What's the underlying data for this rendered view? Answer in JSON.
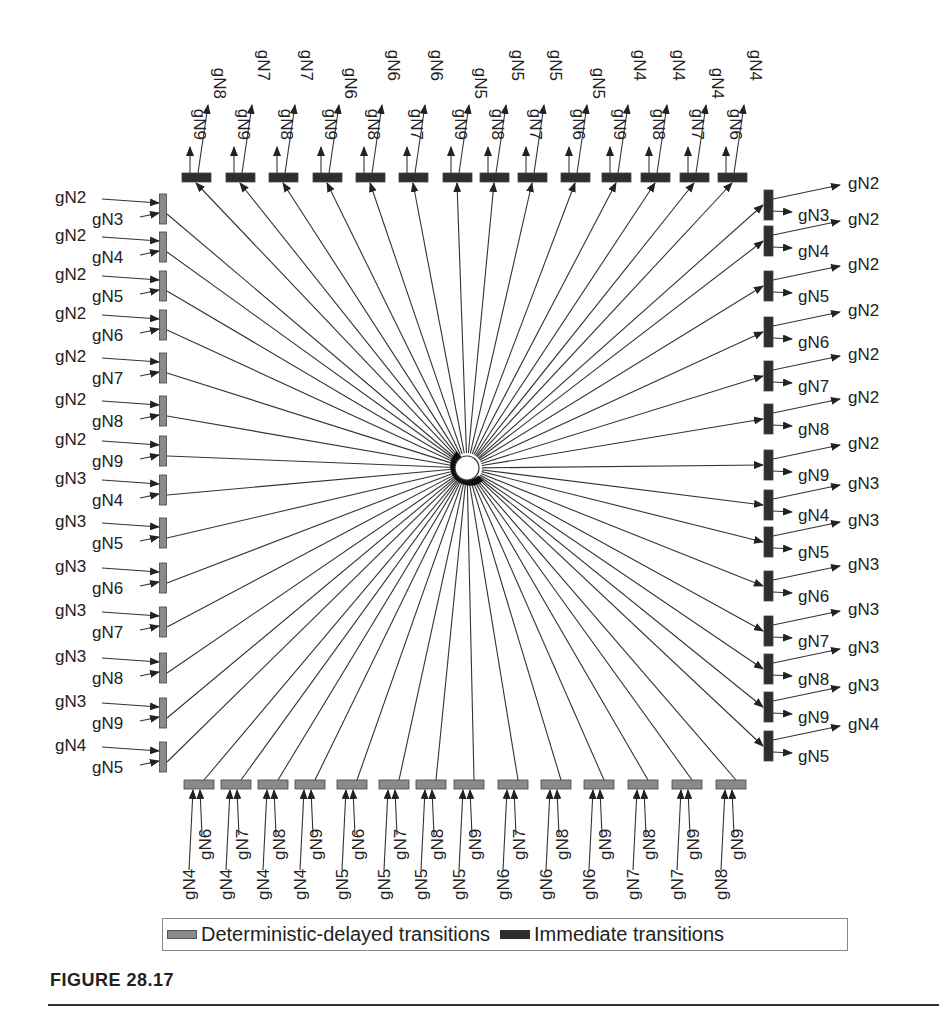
{
  "figure": {
    "caption": "FIGURE 28.17",
    "legend": {
      "deterministic_label": "Deterministic-delayed transitions",
      "immediate_label": "Immediate transitions"
    },
    "colors": {
      "deterministic": "#8a8a8a",
      "immediate": "#2e2e2e",
      "arc": "#333333"
    },
    "center_place": {
      "name": "central-place",
      "has_token_arc": true
    },
    "top_immediate": [
      {
        "near": "gN9",
        "far": "gN8"
      },
      {
        "near": "gN9",
        "far": "gN7"
      },
      {
        "near": "gN8",
        "far": "gN7"
      },
      {
        "near": "gN9",
        "far": "gN6"
      },
      {
        "near": "gN8",
        "far": "gN6"
      },
      {
        "near": "gN7",
        "far": "gN6"
      },
      {
        "near": "gN9",
        "far": "gN5"
      },
      {
        "near": "gN8",
        "far": "gN5"
      },
      {
        "near": "gN7",
        "far": "gN5"
      },
      {
        "near": "gN6",
        "far": "gN5"
      },
      {
        "near": "gN9",
        "far": "gN4"
      },
      {
        "near": "gN8",
        "far": "gN4"
      },
      {
        "near": "gN7",
        "far": "gN4"
      },
      {
        "near": "gN6",
        "far": "gN4"
      }
    ],
    "left_deterministic": [
      {
        "a": "gN2",
        "b": "gN3"
      },
      {
        "a": "gN2",
        "b": "gN4"
      },
      {
        "a": "gN2",
        "b": "gN5"
      },
      {
        "a": "gN2",
        "b": "gN6"
      },
      {
        "a": "gN2",
        "b": "gN7"
      },
      {
        "a": "gN2",
        "b": "gN8"
      },
      {
        "a": "gN2",
        "b": "gN9"
      },
      {
        "a": "gN3",
        "b": "gN4"
      },
      {
        "a": "gN3",
        "b": "gN5"
      },
      {
        "a": "gN3",
        "b": "gN6"
      },
      {
        "a": "gN3",
        "b": "gN7"
      },
      {
        "a": "gN3",
        "b": "gN8"
      },
      {
        "a": "gN3",
        "b": "gN9"
      },
      {
        "a": "gN4",
        "b": "gN5"
      }
    ],
    "right_immediate": [
      {
        "a": "gN2",
        "b": "gN3"
      },
      {
        "a": "gN2",
        "b": "gN4"
      },
      {
        "a": "gN2",
        "b": "gN5"
      },
      {
        "a": "gN2",
        "b": "gN6"
      },
      {
        "a": "gN2",
        "b": "gN7"
      },
      {
        "a": "gN2",
        "b": "gN8"
      },
      {
        "a": "gN2",
        "b": "gN9"
      },
      {
        "a": "gN3",
        "b": "gN4"
      },
      {
        "a": "gN3",
        "b": "gN5"
      },
      {
        "a": "gN3",
        "b": "gN6"
      },
      {
        "a": "gN3",
        "b": "gN7"
      },
      {
        "a": "gN3",
        "b": "gN8"
      },
      {
        "a": "gN3",
        "b": "gN9"
      },
      {
        "a": "gN4",
        "b": "gN5"
      }
    ],
    "bottom_deterministic": [
      {
        "far": "gN4",
        "near": "gN6"
      },
      {
        "far": "gN4",
        "near": "gN7"
      },
      {
        "far": "gN4",
        "near": "gN8"
      },
      {
        "far": "gN4",
        "near": "gN9"
      },
      {
        "far": "gN5",
        "near": "gN6"
      },
      {
        "far": "gN5",
        "near": "gN7"
      },
      {
        "far": "gN5",
        "near": "gN8"
      },
      {
        "far": "gN5",
        "near": "gN9"
      },
      {
        "far": "gN6",
        "near": "gN7"
      },
      {
        "far": "gN6",
        "near": "gN8"
      },
      {
        "far": "gN6",
        "near": "gN9"
      },
      {
        "far": "gN7",
        "near": "gN8"
      },
      {
        "far": "gN7",
        "near": "gN9"
      },
      {
        "far": "gN8",
        "near": "gN9"
      }
    ]
  }
}
